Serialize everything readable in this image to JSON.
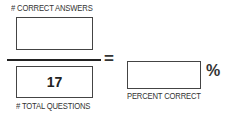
{
  "numerator": {
    "label": "# CORRECT ANSWERS",
    "value": "",
    "placeholder": ""
  },
  "denominator": {
    "label": "# TOTAL QUESTIONS",
    "value": "17"
  },
  "equals_symbol": "=",
  "result": {
    "label": "PERCENT CORRECT",
    "value": "",
    "unit": "%"
  }
}
